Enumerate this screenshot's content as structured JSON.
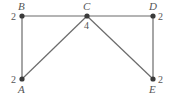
{
  "graph": {
    "nodes": [
      {
        "id": "A",
        "label": "A",
        "degree": "2",
        "x": 22,
        "y": 79
      },
      {
        "id": "B",
        "label": "B",
        "degree": "2",
        "x": 22,
        "y": 16
      },
      {
        "id": "C",
        "label": "C",
        "degree": "4",
        "x": 87,
        "y": 16
      },
      {
        "id": "D",
        "label": "D",
        "degree": "2",
        "x": 153,
        "y": 16
      },
      {
        "id": "E",
        "label": "E",
        "degree": "2",
        "x": 153,
        "y": 79
      }
    ],
    "edges": [
      [
        "B",
        "C"
      ],
      [
        "C",
        "D"
      ],
      [
        "B",
        "A"
      ],
      [
        "D",
        "E"
      ],
      [
        "C",
        "A"
      ],
      [
        "C",
        "E"
      ]
    ],
    "colors": {
      "edge": "#6b6b6b",
      "node": "#3a3a3a",
      "text": "#555555"
    }
  }
}
